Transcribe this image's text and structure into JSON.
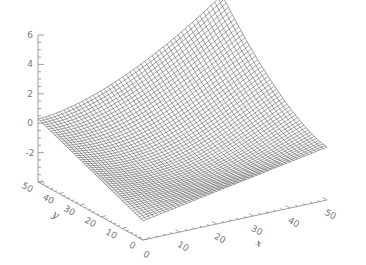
{
  "chart_data": {
    "type": "surface",
    "title": "",
    "xlabel": "x",
    "ylabel": "y",
    "zlabel": "",
    "x_ticks": [
      0,
      10,
      20,
      30,
      40,
      50
    ],
    "y_ticks": [
      0,
      10,
      20,
      30,
      40,
      50
    ],
    "z_ticks": [
      -4,
      -2,
      0,
      2,
      4,
      6
    ],
    "z_tick_labels_visible": [
      "-2",
      "0",
      "2",
      "4",
      "6"
    ],
    "xlim": [
      0,
      50
    ],
    "ylim": [
      0,
      50
    ],
    "zlim": [
      -4,
      6
    ],
    "grid_size": [
      50,
      50
    ],
    "corner_values": {
      "x0_y0": -2.7,
      "x50_y0": -0.4,
      "x0_y50": 0.3,
      "x50_y50": 6.0
    },
    "style": "wireframe mesh, black lines on white, IDL-style axes",
    "legend": null
  },
  "colors": {
    "mesh": "#333333",
    "axis": "#888888",
    "background": "#ffffff"
  }
}
